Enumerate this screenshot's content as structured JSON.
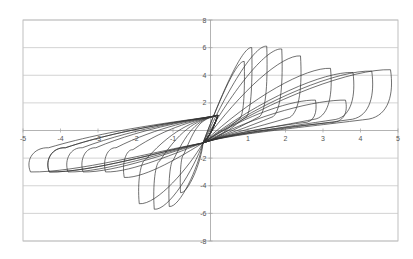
{
  "chart_data": {
    "type": "line",
    "title": "",
    "xlabel": "",
    "ylabel": "",
    "xlim": [
      -5,
      5
    ],
    "ylim": [
      -8,
      8
    ],
    "grid": {
      "horizontal": true,
      "vertical": false
    },
    "legend": null,
    "x_ticks": [
      -5,
      -4,
      -3,
      -2,
      -1,
      1,
      2,
      3,
      4,
      5
    ],
    "x_tick_labels": [
      "-5",
      "-4",
      "-3",
      "-2",
      "-1",
      "1",
      "2",
      "3",
      "4",
      "5"
    ],
    "y_ticks": [
      8,
      6,
      4,
      2,
      -2,
      -4,
      -6,
      -8
    ],
    "y_tick_labels": [
      "8",
      "6",
      "4",
      "2",
      "-2",
      "-4",
      "-6",
      "-8"
    ],
    "series": [
      {
        "name": "cycle-1",
        "pos_peak": [
          0.9,
          5.0
        ],
        "neg_peak": [
          -0.8,
          -4.5
        ]
      },
      {
        "name": "cycle-2",
        "pos_peak": [
          1.1,
          6.0
        ],
        "neg_peak": [
          -1.1,
          -5.5
        ]
      },
      {
        "name": "cycle-3",
        "pos_peak": [
          1.5,
          6.1
        ],
        "neg_peak": [
          -1.5,
          -5.7
        ]
      },
      {
        "name": "cycle-4",
        "pos_peak": [
          1.9,
          5.9
        ],
        "neg_peak": [
          -1.9,
          -5.3
        ]
      },
      {
        "name": "cycle-5",
        "pos_peak": [
          2.4,
          5.4
        ],
        "neg_peak": [
          -2.3,
          -3.4
        ]
      },
      {
        "name": "cycle-6",
        "pos_peak": [
          2.8,
          2.2
        ],
        "neg_peak": [
          -2.8,
          -3.0
        ]
      },
      {
        "name": "cycle-7",
        "pos_peak": [
          3.2,
          4.5
        ],
        "neg_peak": [
          -3.4,
          -3.0
        ]
      },
      {
        "name": "cycle-8",
        "pos_peak": [
          3.6,
          2.2
        ],
        "neg_peak": [
          -3.8,
          -3.0
        ]
      },
      {
        "name": "cycle-9",
        "pos_peak": [
          3.8,
          4.2
        ],
        "neg_peak": [
          -4.3,
          -3.0
        ]
      },
      {
        "name": "cycle-10",
        "pos_peak": [
          4.3,
          4.3
        ],
        "neg_peak": [
          -4.3,
          -3.0
        ]
      },
      {
        "name": "cycle-11",
        "pos_peak": [
          4.8,
          4.4
        ],
        "neg_peak": [
          -4.8,
          -3.0
        ]
      }
    ]
  },
  "style": {
    "line_color": "#333333",
    "grid_color": "#c8c8c8",
    "axis_color": "#a0a0a0",
    "frame_color": "#b0b0b0"
  }
}
